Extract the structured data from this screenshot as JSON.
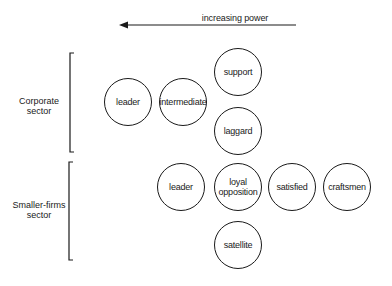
{
  "title_arrow": {
    "label": "increasing power",
    "direction": "left"
  },
  "sectors": [
    {
      "label_line1": "Corporate",
      "label_line2": "sector",
      "roles": [
        {
          "label": "leader"
        },
        {
          "label": "intermediate"
        },
        {
          "label": "support"
        },
        {
          "label": "laggard"
        }
      ]
    },
    {
      "label_line1": "Smaller-firms",
      "label_line2": "sector",
      "roles": [
        {
          "label": "leader"
        },
        {
          "label_line1": "loyal",
          "label_line2": "opposition"
        },
        {
          "label": "satisfied"
        },
        {
          "label": "craftsmen"
        },
        {
          "label": "satellite"
        }
      ]
    }
  ],
  "colors": {
    "line": "#1a1a1a",
    "background": "#ffffff"
  }
}
